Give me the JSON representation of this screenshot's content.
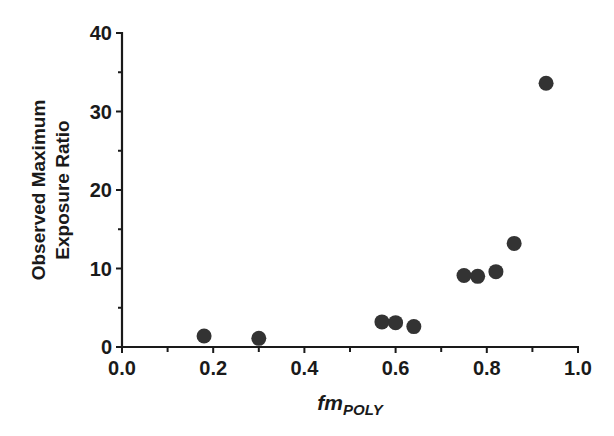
{
  "chart_data": {
    "type": "scatter",
    "title": "",
    "xlabel": "fmPOLY",
    "xlabel_main": "fm",
    "xlabel_sub": "POLY",
    "ylabel": "Observed Maximum Exposure Ratio",
    "ylabel_line1": "Observed Maximum",
    "ylabel_line2": "Exposure Ratio",
    "xlim": [
      0.0,
      1.0
    ],
    "ylim": [
      0,
      40
    ],
    "x_ticks": [
      "0.0",
      "0.2",
      "0.4",
      "0.6",
      "0.8",
      "1.0"
    ],
    "x_tick_values": [
      0.0,
      0.2,
      0.4,
      0.6,
      0.8,
      1.0
    ],
    "y_ticks": [
      "0",
      "10",
      "20",
      "30",
      "40"
    ],
    "y_tick_values": [
      0,
      10,
      20,
      30,
      40
    ],
    "grid": false,
    "legend": null,
    "marker_color": "#333333",
    "series": [
      {
        "name": "data",
        "points": [
          {
            "x": 0.18,
            "y": 1.4
          },
          {
            "x": 0.3,
            "y": 1.1
          },
          {
            "x": 0.57,
            "y": 3.2
          },
          {
            "x": 0.6,
            "y": 3.1
          },
          {
            "x": 0.64,
            "y": 2.6
          },
          {
            "x": 0.75,
            "y": 9.1
          },
          {
            "x": 0.78,
            "y": 9.0
          },
          {
            "x": 0.82,
            "y": 9.6
          },
          {
            "x": 0.86,
            "y": 13.2
          },
          {
            "x": 0.93,
            "y": 33.6
          }
        ]
      }
    ]
  }
}
